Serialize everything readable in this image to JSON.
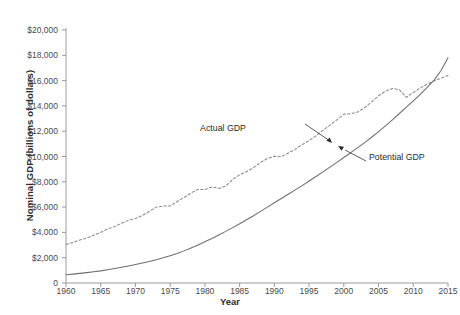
{
  "chart_data": {
    "type": "line",
    "title": "",
    "xlabel": "Year",
    "ylabel": "Nominal GDP (billions of dollars)",
    "xlim": [
      1960,
      2015
    ],
    "ylim": [
      0,
      20000
    ],
    "grid": false,
    "legend_position": "annotations-inline",
    "xticks": [
      1960,
      1965,
      1970,
      1975,
      1980,
      1985,
      1990,
      1995,
      2000,
      2005,
      2010,
      2015
    ],
    "xtick_labels": [
      "1960",
      "1965",
      "1970",
      "1975",
      "1980",
      "1985",
      "1990",
      "1995",
      "2000",
      "2005",
      "2010",
      "2015"
    ],
    "yticks": [
      0,
      2000,
      4000,
      6000,
      8000,
      10000,
      12000,
      14000,
      16000,
      18000,
      20000
    ],
    "ytick_labels": [
      "0",
      "$2,000",
      "$4,000",
      "$6,000",
      "$8,000",
      "$10,000",
      "$12,000",
      "$14,000",
      "$16,000",
      "$18,000",
      "$20,000"
    ],
    "x": [
      1960,
      1961,
      1962,
      1963,
      1964,
      1965,
      1966,
      1967,
      1968,
      1969,
      1970,
      1971,
      1972,
      1973,
      1974,
      1975,
      1976,
      1977,
      1978,
      1979,
      1980,
      1981,
      1982,
      1983,
      1984,
      1985,
      1986,
      1987,
      1988,
      1989,
      1990,
      1991,
      1992,
      1993,
      1994,
      1995,
      1996,
      1997,
      1998,
      1999,
      2000,
      2001,
      2002,
      2003,
      2004,
      2005,
      2006,
      2007,
      2008,
      2009,
      2010,
      2011,
      2012,
      2013,
      2014,
      2015
    ],
    "series": [
      {
        "name": "Actual GDP",
        "style": "dashed",
        "color": "#8a8a8a",
        "values": [
          3050,
          3200,
          3400,
          3560,
          3780,
          4000,
          4280,
          4460,
          4720,
          4960,
          5100,
          5340,
          5660,
          6000,
          6080,
          6080,
          6440,
          6760,
          7120,
          7400,
          7380,
          7600,
          7480,
          7660,
          8180,
          8560,
          8800,
          9120,
          9520,
          9840,
          10020,
          9980,
          10280,
          10560,
          10940,
          11260,
          11640,
          12080,
          12480,
          12900,
          13340,
          13380,
          13520,
          13860,
          14320,
          14800,
          15160,
          15380,
          15280,
          14680,
          15060,
          15420,
          15720,
          15980,
          16200,
          16400
        ]
      },
      {
        "name": "Potential GDP",
        "style": "solid",
        "color": "#6e6e6e",
        "values": [
          650,
          700,
          760,
          820,
          890,
          960,
          1050,
          1140,
          1240,
          1350,
          1460,
          1580,
          1700,
          1840,
          1990,
          2160,
          2340,
          2540,
          2760,
          3000,
          3260,
          3520,
          3800,
          4080,
          4380,
          4680,
          5000,
          5320,
          5660,
          6000,
          6340,
          6680,
          7020,
          7360,
          7700,
          8060,
          8420,
          8780,
          9160,
          9540,
          9920,
          10300,
          10700,
          11100,
          11520,
          11960,
          12420,
          12900,
          13400,
          13900,
          14400,
          14920,
          15460,
          16040,
          16800,
          17800
        ]
      }
    ],
    "annotations": [
      {
        "text": "Actual GDP",
        "target_series": "Actual GDP",
        "target_x": 1999,
        "target_y": 12900
      },
      {
        "text": "Potential GDP",
        "target_series": "Potential GDP",
        "target_x": 2001,
        "target_y": 10300
      }
    ]
  }
}
